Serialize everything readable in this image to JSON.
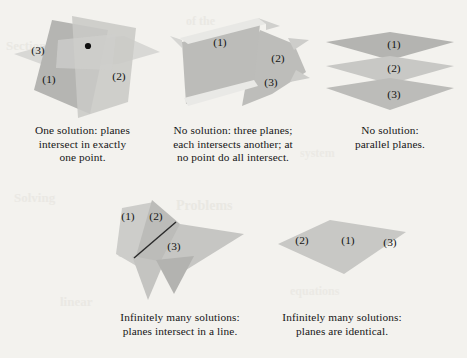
{
  "page": {
    "background_color": "#f3f2ee",
    "ink_color": "#161616",
    "bleed_through": [
      {
        "text": "Section",
        "x": 6,
        "y": 44,
        "size": 13,
        "opacity": 0.55
      },
      {
        "text": "of the",
        "x": 186,
        "y": 20,
        "size": 12,
        "opacity": 0.5
      },
      {
        "text": "system",
        "x": 300,
        "y": 150,
        "size": 12,
        "opacity": 0.45
      },
      {
        "text": "Solving",
        "x": 14,
        "y": 196,
        "size": 13,
        "opacity": 0.5
      },
      {
        "text": "Problems",
        "x": 176,
        "y": 204,
        "size": 14,
        "opacity": 0.55
      },
      {
        "text": "linear",
        "x": 60,
        "y": 300,
        "size": 13,
        "opacity": 0.5
      },
      {
        "text": "equations",
        "x": 290,
        "y": 290,
        "size": 12,
        "opacity": 0.45
      }
    ]
  },
  "plane_colors": {
    "lightest": "#e3e3e1",
    "light": "#d3d3d1",
    "mid": "#c3c3c0",
    "dark": "#b0b0ad",
    "darker": "#9d9d9a",
    "edge_highlight": "#ededea",
    "dot": "#101010",
    "line": "#2b2b2b"
  },
  "figures": [
    {
      "id": "one-point",
      "name": "figure-one-solution-point",
      "plane_labels": [
        "(1)",
        "(2)",
        "(3)"
      ],
      "has_intersection_dot": true,
      "caption": {
        "lines": [
          "One solution: planes",
          "intersect in exactly",
          "one point."
        ]
      }
    },
    {
      "id": "prism",
      "name": "figure-no-solution-prism",
      "plane_labels": [
        "(1)",
        "(2)",
        "(3)"
      ],
      "has_intersection_dot": false,
      "caption": {
        "lines": [
          "No solution: three planes;",
          "each intersects another; at",
          "no point do all intersect."
        ]
      }
    },
    {
      "id": "parallel",
      "name": "figure-no-solution-parallel",
      "plane_labels": [
        "(1)",
        "(2)",
        "(3)"
      ],
      "has_intersection_dot": false,
      "caption": {
        "lines": [
          "No solution:",
          "parallel planes."
        ]
      }
    },
    {
      "id": "line",
      "name": "figure-infinite-solutions-line",
      "plane_labels": [
        "(1)",
        "(2)",
        "(3)"
      ],
      "has_intersection_line": true,
      "caption": {
        "lines": [
          "Infinitely many solutions:",
          "planes intersect in a line."
        ]
      }
    },
    {
      "id": "identical",
      "name": "figure-infinite-solutions-identical",
      "plane_labels": [
        "(2)",
        "(1)",
        "(3)"
      ],
      "has_intersection_dot": false,
      "caption": {
        "lines": [
          "Infinitely many solutions:",
          "planes are identical."
        ]
      }
    }
  ]
}
